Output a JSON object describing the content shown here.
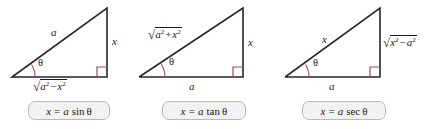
{
  "figure": {
    "background_color": "#ffffff",
    "line_color": "#262626",
    "accent_color": "#a14b5a",
    "box_fill": "#f2f2f2",
    "box_border": "#b9b9b9"
  },
  "panels": [
    {
      "id": "panel-sin",
      "hypotenuse_label": "a",
      "opposite_label": "x",
      "adjacent_label": {
        "radical": "√",
        "term1": "a",
        "exp1": "2",
        "operator": "−",
        "term2": "x",
        "exp2": "2",
        "text": "√(a² − x²)"
      },
      "angle_label": "θ",
      "right_angle_marker": "right-angle",
      "formula": {
        "lhs": "x",
        "equals": "=",
        "coefficient": "a",
        "function": "sin",
        "argument": "θ",
        "text": "x = a sin θ"
      }
    },
    {
      "id": "panel-tan",
      "hypotenuse_label": {
        "radical": "√",
        "term1": "a",
        "exp1": "2",
        "operator": "+",
        "term2": "x",
        "exp2": "2",
        "text": "√(a² + x²)"
      },
      "opposite_label": "x",
      "adjacent_label": "a",
      "angle_label": "θ",
      "right_angle_marker": "right-angle",
      "formula": {
        "lhs": "x",
        "equals": "=",
        "coefficient": "a",
        "function": "tan",
        "argument": "θ",
        "text": "x = a tan θ"
      }
    },
    {
      "id": "panel-sec",
      "hypotenuse_label": "x",
      "opposite_label": {
        "radical": "√",
        "term1": "x",
        "exp1": "2",
        "operator": "−",
        "term2": "a",
        "exp2": "2",
        "text": "√(x² − a²)"
      },
      "adjacent_label": "a",
      "angle_label": "θ",
      "right_angle_marker": "right-angle",
      "formula": {
        "lhs": "x",
        "equals": "=",
        "coefficient": "a",
        "function": "sec",
        "argument": "θ",
        "text": "x = a sec θ"
      }
    }
  ]
}
